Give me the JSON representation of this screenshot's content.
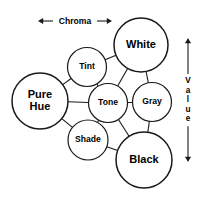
{
  "diagram": {
    "background_color": "#ffffff",
    "stroke_color": "#1a1a1a",
    "text_color": "#000000",
    "nodes": [
      {
        "id": "pure-hue",
        "label_line1": "Pure",
        "label_line2": "Hue",
        "label": "Pure Hue",
        "cx": 40,
        "cy": 101,
        "r": 28,
        "font_size": 11,
        "two_line": true
      },
      {
        "id": "tint",
        "label_line1": "Tint",
        "label_line2": "",
        "label": "Tint",
        "cx": 87,
        "cy": 67,
        "r": 19.5,
        "font_size": 8.6,
        "two_line": false
      },
      {
        "id": "white",
        "label_line1": "White",
        "label_line2": "",
        "label": "White",
        "cx": 141,
        "cy": 45,
        "r": 27,
        "font_size": 11,
        "two_line": false
      },
      {
        "id": "tone",
        "label_line1": "Tone",
        "label_line2": "",
        "label": "Tone",
        "cx": 108,
        "cy": 103,
        "r": 19.5,
        "font_size": 8.6,
        "two_line": false
      },
      {
        "id": "gray",
        "label_line1": "Gray",
        "label_line2": "",
        "label": "Gray",
        "cx": 152,
        "cy": 102,
        "r": 19.5,
        "font_size": 8.6,
        "two_line": false
      },
      {
        "id": "shade",
        "label_line1": "Shade",
        "label_line2": "",
        "label": "Shade",
        "cx": 88,
        "cy": 140,
        "r": 20,
        "font_size": 8.6,
        "two_line": false
      },
      {
        "id": "black",
        "label_line1": "Black",
        "label_line2": "",
        "label": "Black",
        "cx": 144,
        "cy": 160,
        "r": 28,
        "font_size": 11,
        "two_line": false
      }
    ],
    "links": [
      {
        "id": "pure-hue-to-tone",
        "from": "pure-hue",
        "to": "tone"
      },
      {
        "id": "pure-hue-to-tint",
        "from": "pure-hue",
        "to": "tint"
      },
      {
        "id": "pure-hue-to-shade",
        "from": "pure-hue",
        "to": "shade"
      },
      {
        "id": "tint-to-white",
        "from": "tint",
        "to": "white"
      },
      {
        "id": "tint-to-tone",
        "from": "tint",
        "to": "tone"
      },
      {
        "id": "white-to-tone",
        "from": "white",
        "to": "tone"
      },
      {
        "id": "white-to-gray",
        "from": "white",
        "to": "gray"
      },
      {
        "id": "tone-to-gray",
        "from": "tone",
        "to": "gray"
      },
      {
        "id": "tone-to-shade",
        "from": "tone",
        "to": "shade"
      },
      {
        "id": "tone-to-black",
        "from": "tone",
        "to": "black"
      },
      {
        "id": "shade-to-black",
        "from": "shade",
        "to": "black"
      },
      {
        "id": "gray-to-black",
        "from": "gray",
        "to": "black"
      }
    ],
    "axes": [
      {
        "id": "chroma-axis",
        "label": "Chroma",
        "orientation": "horizontal",
        "x1": 38,
        "y1": 21,
        "x2": 112,
        "y2": 21,
        "label_x": 75,
        "label_y": 21,
        "font_size": 8.6,
        "double_headed": true
      },
      {
        "id": "value-axis",
        "label": "Value",
        "letters": [
          "V",
          "a",
          "l",
          "u",
          "e"
        ],
        "orientation": "vertical",
        "x1": 188,
        "y1": 38,
        "x2": 188,
        "y2": 162,
        "label_x": 188,
        "label_y": 100,
        "font_size": 8.2,
        "letter_spacing": 9.5,
        "double_headed": true
      }
    ]
  }
}
